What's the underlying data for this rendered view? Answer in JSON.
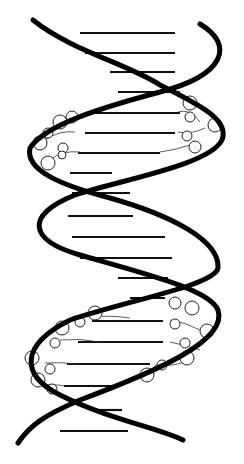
{
  "figure": {
    "style": "black-and-white line illustration",
    "colors": {
      "background": "#ffffff",
      "ink": "#000000"
    },
    "strands": 2,
    "detailed_loops": [
      {
        "position": "upper",
        "y_range": [
          100,
          185
        ]
      },
      {
        "position": "lower",
        "y_range": [
          300,
          400
        ]
      }
    ],
    "base_pair_rungs": [
      {
        "y": 33,
        "x1": 80,
        "x2": 175
      },
      {
        "y": 53,
        "x1": 85,
        "x2": 175
      },
      {
        "y": 72,
        "x1": 110,
        "x2": 175
      },
      {
        "y": 92,
        "x1": 118,
        "x2": 180
      },
      {
        "y": 113,
        "x1": 96,
        "x2": 180
      },
      {
        "y": 133,
        "x1": 85,
        "x2": 175
      },
      {
        "y": 153,
        "x1": 78,
        "x2": 160
      },
      {
        "y": 173,
        "x1": 70,
        "x2": 112
      },
      {
        "y": 193,
        "x1": 72,
        "x2": 130
      },
      {
        "y": 216,
        "x1": 68,
        "x2": 133
      },
      {
        "y": 237,
        "x1": 72,
        "x2": 165
      },
      {
        "y": 258,
        "x1": 80,
        "x2": 172
      },
      {
        "y": 278,
        "x1": 118,
        "x2": 168
      },
      {
        "y": 298,
        "x1": 130,
        "x2": 165
      },
      {
        "y": 321,
        "x1": 92,
        "x2": 163
      },
      {
        "y": 342,
        "x1": 78,
        "x2": 163
      },
      {
        "y": 364,
        "x1": 67,
        "x2": 150
      },
      {
        "y": 386,
        "x1": 64,
        "x2": 118
      },
      {
        "y": 410,
        "x1": 90,
        "x2": 122
      },
      {
        "y": 431,
        "x1": 60,
        "x2": 128
      }
    ]
  }
}
